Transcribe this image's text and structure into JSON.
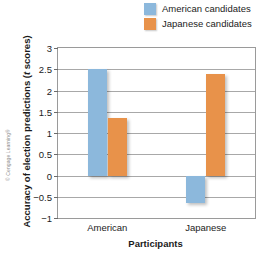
{
  "chart_data": {
    "type": "bar",
    "title": "",
    "xlabel": "Participants",
    "ylabel": "Accuracy of election predictions (t scores)",
    "ylabel_plain": "Accuracy of election predictions (",
    "ylabel_italic": "t",
    "ylabel_tail": " scores)",
    "categories": [
      "American",
      "Japanese"
    ],
    "series": [
      {
        "name": "American candidates",
        "color": "#8CB8DC",
        "values": [
          2.5,
          -0.65
        ]
      },
      {
        "name": "Japanese candidates",
        "color": "#E8924A",
        "values": [
          1.35,
          2.4
        ]
      }
    ],
    "ylim": [
      -1,
      3
    ],
    "yticks": [
      3,
      2.5,
      2,
      1.5,
      1,
      0.5,
      0,
      -0.5,
      -1
    ],
    "ytick_labels": [
      "3",
      "2.5",
      "2",
      "1.5",
      "1",
      "0.5",
      "0",
      "-0.5",
      "-1"
    ],
    "grid": true,
    "legend_position": "top-right"
  },
  "credit": "© Cengage Learning®"
}
